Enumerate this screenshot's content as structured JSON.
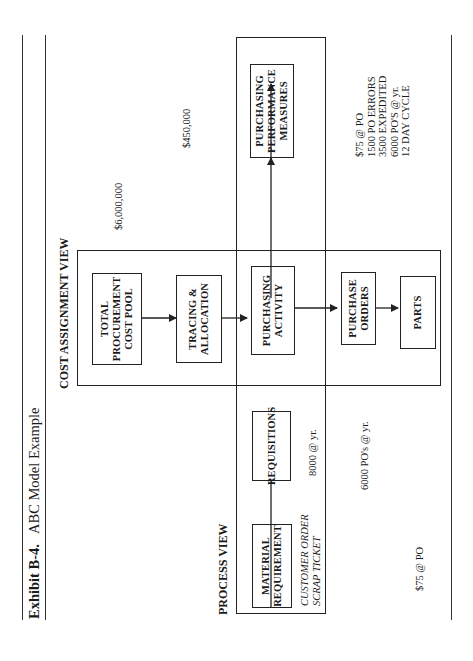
{
  "orientation": "rotated-90-ccw",
  "exhibit": {
    "number_label": "Exhibit B-4.",
    "title": "ABC Model Example"
  },
  "views": {
    "cost_assignment": {
      "heading": "COST ASSIGNMENT VIEW"
    },
    "process": {
      "heading": "PROCESS VIEW"
    }
  },
  "boxes": {
    "total_pool": {
      "lines": [
        "TOTAL",
        "PROCUREMENT",
        "COST POOL"
      ]
    },
    "tracing": {
      "lines": [
        "TRACING &",
        "ALLOCATION"
      ]
    },
    "purchasing_activity": {
      "lines": [
        "PURCHASING",
        "ACTIVITY"
      ]
    },
    "purchase_orders": {
      "lines": [
        "PURCHASE",
        "ORDERS"
      ]
    },
    "parts": {
      "lines": [
        "PARTS"
      ]
    },
    "performance_measures": {
      "lines": [
        "PURCHASING",
        "PERFORMANCE",
        "MEASURES"
      ]
    },
    "material_requirement": {
      "lines": [
        "MATERIAL",
        "REQUIREMENT"
      ]
    },
    "requisitions": {
      "lines": [
        "REQUISITIONS"
      ]
    }
  },
  "annotations": {
    "total_cost": "$6,000,000",
    "activity_cost": "$450,000",
    "triggers": [
      "CUSTOMER ORDER",
      "SCRAP TICKET"
    ],
    "requisitions_volume": "8000 @ yr.",
    "po_volume": "6000 PO's @ yr.",
    "cost_per_po": "$75 @ PO",
    "performance": [
      "$75 @ PO",
      "1500 PO ERRORS",
      "3500 EXPEDITED",
      "6000  PO'S @ yr.",
      "12 DAY CYCLE"
    ]
  },
  "colors": {
    "ink": "#222222",
    "background": "#ffffff"
  }
}
